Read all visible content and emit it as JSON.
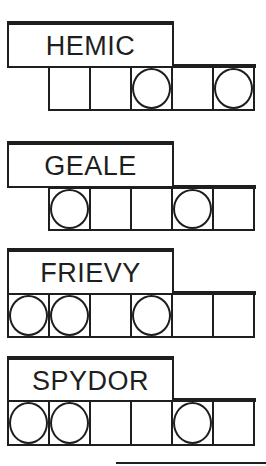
{
  "puzzle": {
    "words": [
      {
        "scrambled": "HEMIC",
        "letter_count": 5,
        "circled_positions": [
          3,
          5
        ]
      },
      {
        "scrambled": "GEALE",
        "letter_count": 5,
        "circled_positions": [
          1,
          4
        ]
      },
      {
        "scrambled": "FRIEVY",
        "letter_count": 6,
        "circled_positions": [
          1,
          2,
          4
        ]
      },
      {
        "scrambled": "SPYDOR",
        "letter_count": 6,
        "circled_positions": [
          1,
          2,
          5
        ]
      }
    ]
  },
  "colors": {
    "ink": "#1e1e1e",
    "background": "#ffffff"
  }
}
